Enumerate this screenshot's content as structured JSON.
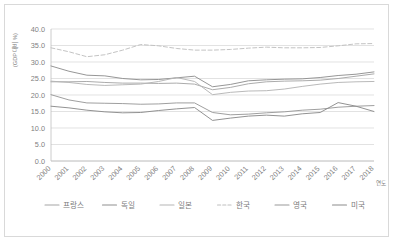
{
  "chart_data": {
    "type": "line",
    "title": "",
    "xlabel": "연도",
    "ylabel": "(GDP 대비 %)",
    "ylim": [
      0.0,
      40.0
    ],
    "ytick_labels": [
      "40.0",
      "35.0",
      "30.0",
      "25.0",
      "20.0",
      "15.0",
      "10.0",
      "5.0",
      "0.0"
    ],
    "ytick_values": [
      40,
      35,
      30,
      25,
      20,
      15,
      10,
      5,
      0
    ],
    "grid": true,
    "legend_position": "bottom",
    "categories": [
      "2000",
      "2001",
      "2002",
      "2003",
      "2004",
      "2005",
      "2006",
      "2007",
      "2008",
      "2009",
      "2010",
      "2011",
      "2012",
      "2013",
      "2014",
      "2015",
      "2016",
      "2017",
      "2018"
    ],
    "series": [
      {
        "name": "프랑스",
        "style": "solid",
        "color": "#a6a6a6",
        "values": [
          24.0,
          24.0,
          24.1,
          23.8,
          23.6,
          23.6,
          23.5,
          23.6,
          23.3,
          21.6,
          22.3,
          23.4,
          24.0,
          24.2,
          24.3,
          24.5,
          25.0,
          25.7,
          26.4
        ]
      },
      {
        "name": "독일",
        "style": "solid",
        "color": "#909090",
        "values": [
          28.8,
          27.2,
          26.0,
          25.8,
          25.0,
          24.6,
          24.7,
          25.2,
          25.7,
          22.5,
          23.2,
          24.3,
          24.6,
          24.8,
          24.9,
          25.3,
          25.9,
          26.3,
          27.0
        ]
      },
      {
        "name": "일본",
        "style": "solid",
        "color": "#b5b5b5",
        "values": [
          24.2,
          23.8,
          23.2,
          22.9,
          23.1,
          23.3,
          24.1,
          25.3,
          24.1,
          20.1,
          20.8,
          21.2,
          21.3,
          21.8,
          22.6,
          23.3,
          23.8,
          24.0,
          24.1
        ]
      },
      {
        "name": "한국",
        "style": "dashed",
        "color": "#c0c0c0",
        "values": [
          34.3,
          33.1,
          31.6,
          32.2,
          33.6,
          35.3,
          34.9,
          34.1,
          33.6,
          33.6,
          33.8,
          34.2,
          34.5,
          34.3,
          34.3,
          34.4,
          34.9,
          35.5,
          35.6
        ]
      },
      {
        "name": "영국",
        "style": "solid",
        "color": "#9a9a9a",
        "values": [
          20.1,
          18.5,
          17.6,
          17.5,
          17.4,
          17.2,
          17.3,
          17.6,
          17.6,
          14.7,
          14.0,
          14.2,
          14.6,
          14.9,
          15.4,
          15.7,
          16.3,
          16.6,
          16.8
        ]
      },
      {
        "name": "미국",
        "style": "solid",
        "color": "#8c8c8c",
        "values": [
          16.6,
          16.1,
          15.4,
          14.9,
          14.6,
          14.7,
          15.3,
          15.8,
          16.2,
          12.3,
          13.0,
          13.6,
          13.9,
          13.6,
          14.3,
          14.7,
          17.7,
          16.6,
          15.0
        ]
      }
    ]
  },
  "legend": {
    "items": [
      {
        "label": "프랑스"
      },
      {
        "label": "독일"
      },
      {
        "label": "일본"
      },
      {
        "label": "한국"
      },
      {
        "label": "영국"
      },
      {
        "label": "미국"
      }
    ]
  }
}
